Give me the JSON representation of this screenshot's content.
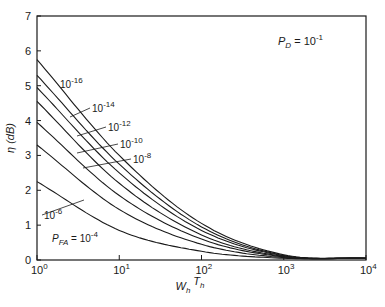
{
  "chart_data": {
    "type": "line",
    "title": "",
    "annotation": {
      "text": "P_D = 10^-1",
      "base": "P",
      "sub": "D",
      "eq": " = 10",
      "sup": "-1"
    },
    "xlabel": {
      "text": "W_h T_h",
      "parts": [
        {
          "b": "W",
          "s": "h"
        },
        {
          "b": "T",
          "s": "h"
        }
      ]
    },
    "ylabel": "η (dB)",
    "xscale": "log",
    "xlim": [
      1,
      10000
    ],
    "ylim": [
      0,
      7
    ],
    "grid": false,
    "x_ticks": [
      {
        "value": 1,
        "base": "10",
        "exp": "0"
      },
      {
        "value": 10,
        "base": "10",
        "exp": "1"
      },
      {
        "value": 100,
        "base": "10",
        "exp": "2"
      },
      {
        "value": 1000,
        "base": "10",
        "exp": "3"
      },
      {
        "value": 10000,
        "base": "10",
        "exp": "4"
      }
    ],
    "y_ticks": [
      "0",
      "1",
      "2",
      "3",
      "4",
      "5",
      "6",
      "7"
    ],
    "x": [
      1,
      10,
      100,
      1000,
      10000
    ],
    "series": [
      {
        "name": "P_FA = 10^-16",
        "label_exp": "-16",
        "values": [
          5.75,
          3.0,
          1.05,
          0.15,
          0.05
        ],
        "dashed_segment": [
          100,
          1000
        ]
      },
      {
        "name": "P_FA = 10^-14",
        "label_exp": "-14",
        "values": [
          5.3,
          2.75,
          0.95,
          0.13,
          0.05
        ]
      },
      {
        "name": "P_FA = 10^-12",
        "label_exp": "-12",
        "values": [
          4.95,
          2.5,
          0.85,
          0.12,
          0.05
        ]
      },
      {
        "name": "P_FA = 10^-10",
        "label_exp": "-10",
        "values": [
          4.55,
          2.2,
          0.72,
          0.1,
          0.05
        ]
      },
      {
        "name": "P_FA = 10^-8",
        "label_exp": "-8",
        "values": [
          3.95,
          1.85,
          0.6,
          0.09,
          0.05
        ]
      },
      {
        "name": "P_FA = 10^-6",
        "label_exp": "-6",
        "values": [
          3.3,
          1.45,
          0.45,
          0.07,
          0.05
        ]
      },
      {
        "name": "P_FA = 10^-4",
        "label_exp": "-4",
        "values": [
          2.25,
          0.85,
          0.25,
          0.05,
          0.05
        ]
      }
    ],
    "curve_labels": [
      {
        "series": 0,
        "text_base": "10",
        "exp": "-16",
        "tx": 60,
        "ty": 88,
        "ax": null,
        "ay": null
      },
      {
        "series": 1,
        "text_base": "10",
        "exp": "-14",
        "tx": 92,
        "ty": 112,
        "ax": 70,
        "ay": 117
      },
      {
        "series": 2,
        "text_base": "10",
        "exp": "-12",
        "tx": 108,
        "ty": 131,
        "ax": 77,
        "ay": 136
      },
      {
        "series": 3,
        "text_base": "10",
        "exp": "-10",
        "tx": 120,
        "ty": 148,
        "ax": 77,
        "ay": 153
      },
      {
        "series": 4,
        "text_base": "10",
        "exp": "-8",
        "tx": 133,
        "ty": 163,
        "ax": 83,
        "ay": 168
      },
      {
        "series": 5,
        "text_base": "10",
        "exp": "-6",
        "tx": 44,
        "ty": 219,
        "ax": 84,
        "ay": 200,
        "prefix": ""
      },
      {
        "series": 6,
        "text_base": "10",
        "exp": "-4",
        "tx": 52,
        "ty": 242,
        "prefix": "P_FA = "
      }
    ],
    "colors": {
      "line": "#1a1a1a",
      "background": "#ffffff"
    }
  }
}
